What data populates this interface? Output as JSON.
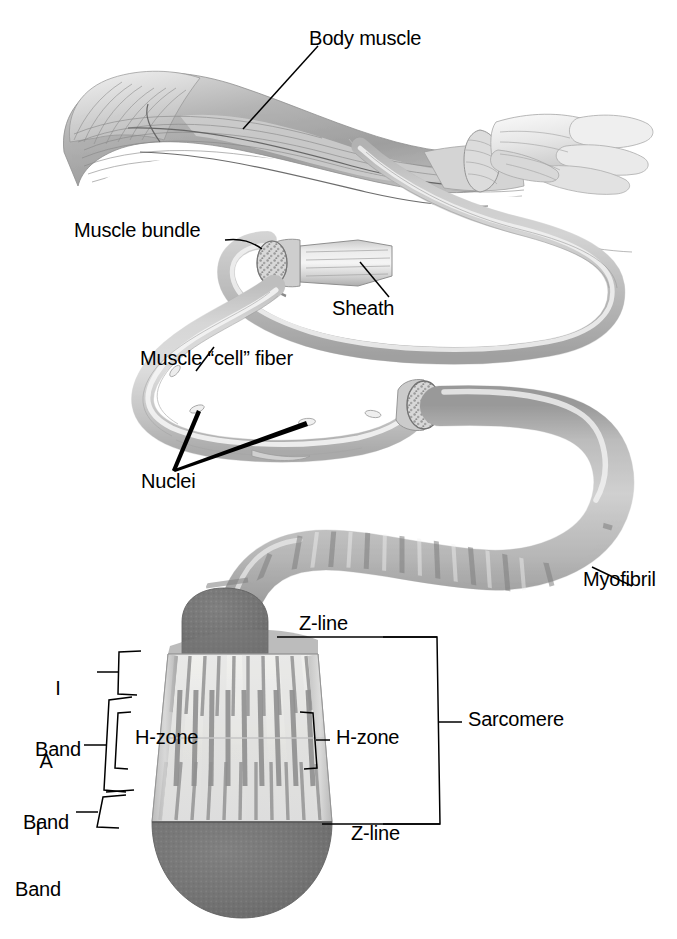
{
  "diagram": {
    "type": "anatomical-illustration",
    "palette": {
      "background": "#ffffff",
      "ink": "#000000",
      "muscle_mid": "#a8a8a8",
      "muscle_light": "#d8d8d8",
      "muscle_dark": "#7a7a7a",
      "sheath": "#c9c9c9",
      "zline_dark": "#6e6e6e",
      "sarcomere_light": "#e9e9e6",
      "filament_gray": "#9a9a9a"
    }
  },
  "labels": {
    "body_muscle": "Body muscle",
    "muscle_bundle": "Muscle bundle",
    "sheath": "Sheath",
    "muscle_cell_fiber": "Muscle “cell” fiber",
    "nuclei": "Nuclei",
    "myofibril": "Myofibril",
    "z_line_top": "Z-line",
    "z_line_bottom": "Z-line",
    "sarcomere": "Sarcomere",
    "h_zone_left": "H-zone",
    "h_zone_right": "H-zone",
    "i_band_top_line1": "I",
    "i_band_top_line2": "Band",
    "a_band_line1": "A",
    "a_band_line2": "Band",
    "i_band_bottom_line1": "I",
    "i_band_bottom_line2": "Band"
  },
  "structures": [
    {
      "name": "body-muscle-arm",
      "label": "Body muscle",
      "level": 1
    },
    {
      "name": "muscle-bundle",
      "label": "Muscle bundle",
      "level": 2
    },
    {
      "name": "sheath",
      "label": "Sheath",
      "level": 2
    },
    {
      "name": "muscle-cell-fiber",
      "label": "Muscle “cell” fiber",
      "level": 3
    },
    {
      "name": "nuclei",
      "label": "Nuclei",
      "level": 3
    },
    {
      "name": "myofibril",
      "label": "Myofibril",
      "level": 4
    },
    {
      "name": "sarcomere",
      "label": "Sarcomere",
      "level": 5
    },
    {
      "name": "z-line",
      "label": "Z-line",
      "level": 5
    },
    {
      "name": "a-band",
      "label": "A Band",
      "level": 5
    },
    {
      "name": "i-band",
      "label": "I Band",
      "level": 5
    },
    {
      "name": "h-zone",
      "label": "H-zone",
      "level": 5
    }
  ]
}
